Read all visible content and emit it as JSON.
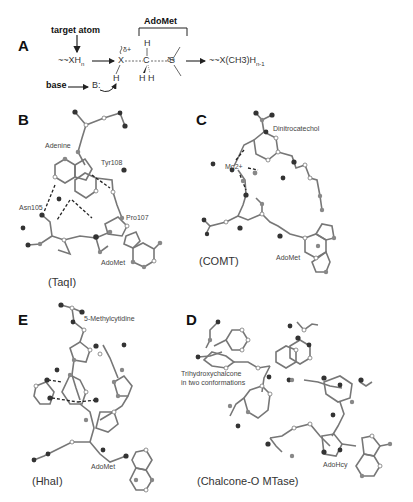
{
  "panel_a": {
    "letter": "A",
    "target_atom_label": "target atom",
    "adomet_label": "AdoMet",
    "base_label": "base",
    "base_symbol": "B:",
    "substrate": "~~XH",
    "substrate_sub": "n",
    "delta_x": "δ+",
    "delta_s": "δ+",
    "atom_x": "X",
    "atom_c": "C",
    "atom_s": "S",
    "atom_h_top": "H",
    "atom_h_bottom": "H H",
    "atom_h_base": "H",
    "product": "~~X(CH3)H",
    "product_sub": "n-1"
  },
  "panel_b": {
    "letter": "B",
    "caption": "(TaqI)",
    "labels": [
      "Adenine",
      "Tyr108",
      "Asn105",
      "Pro107",
      "AdoMet"
    ]
  },
  "panel_c": {
    "letter": "C",
    "caption": "(COMT)",
    "labels": [
      "Dinitrocatechol",
      "Mg2+",
      "AdoMet"
    ]
  },
  "panel_e": {
    "letter": "E",
    "caption": "(HhaI)",
    "labels": [
      "5-Methylcytidine",
      "AdoMet"
    ]
  },
  "panel_d": {
    "letter": "D",
    "caption": "(Chalcone-O MTase)",
    "labels": [
      "Trihydroxychalcone",
      "in two conformations",
      "AdoHcy"
    ]
  },
  "colors": {
    "bond": "#777777",
    "atom_dark": "#333333",
    "atom_grey": "#888888",
    "atom_light": "#ffffff",
    "hbond": "#222222"
  }
}
